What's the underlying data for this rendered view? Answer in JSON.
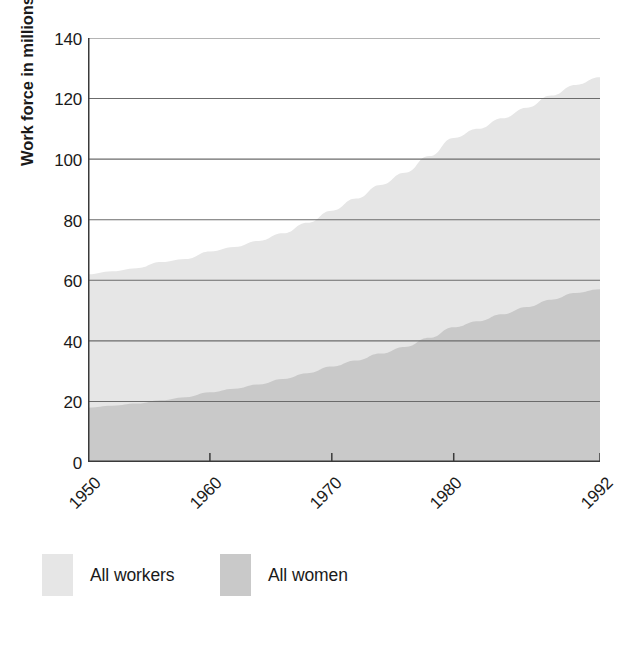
{
  "chart_data": {
    "type": "area",
    "title": "",
    "subtitle": "",
    "xlabel": "",
    "ylabel": "Work force in millions",
    "stacked": false,
    "overlapping": true,
    "grid": true,
    "grid_axis": "y",
    "legend_position": "bottom-left",
    "xlim": [
      1950,
      1992
    ],
    "ylim": [
      0,
      140
    ],
    "yticks": [
      0,
      20,
      40,
      60,
      80,
      100,
      120,
      140
    ],
    "ytick_labels": [
      "0",
      "20",
      "40",
      "60",
      "80",
      "100",
      "120",
      "140"
    ],
    "xticks": [
      1950,
      1960,
      1970,
      1980,
      1992
    ],
    "xtick_labels": [
      "1950",
      "1960",
      "1970",
      "1980",
      "1992"
    ],
    "xtick_rotation_deg": -45,
    "x": [
      1950,
      1952,
      1954,
      1956,
      1958,
      1960,
      1962,
      1964,
      1966,
      1968,
      1970,
      1972,
      1974,
      1976,
      1978,
      1980,
      1982,
      1984,
      1986,
      1988,
      1990,
      1992
    ],
    "series": [
      {
        "name": "All workers",
        "color": "#e6e6e6",
        "values": [
          62,
          63,
          64,
          66,
          67,
          69.5,
          71,
          73,
          75.5,
          79,
          83,
          87,
          91.5,
          95.5,
          101,
          107,
          110,
          113.5,
          117,
          121,
          124.5,
          127
        ]
      },
      {
        "name": "All women",
        "color": "#c9c9c9",
        "values": [
          18,
          18.6,
          19.3,
          20.4,
          21.4,
          23,
          24.2,
          25.6,
          27.4,
          29.3,
          31.5,
          33.5,
          35.8,
          38,
          41,
          44.5,
          46.5,
          48.8,
          51.2,
          53.6,
          55.8,
          57
        ]
      }
    ],
    "annotations": []
  },
  "axis": {
    "ylabel": "Work force in millions",
    "ytick_labels": [
      "140",
      "120",
      "100",
      "80",
      "60",
      "40",
      "20",
      "0"
    ],
    "xtick_labels": [
      "1950",
      "1960",
      "1970",
      "1980",
      "1992"
    ]
  },
  "legend": {
    "items": [
      {
        "label": "All workers",
        "color": "#e6e6e6"
      },
      {
        "label": "All women",
        "color": "#c9c9c9"
      }
    ]
  },
  "colors": {
    "background": "#ffffff",
    "axis_line": "#3a3a3a",
    "grid_line": "#6b6b6b",
    "text": "#1a1a1a",
    "all_workers_fill": "#e6e6e6",
    "all_women_fill": "#c9c9c9"
  }
}
